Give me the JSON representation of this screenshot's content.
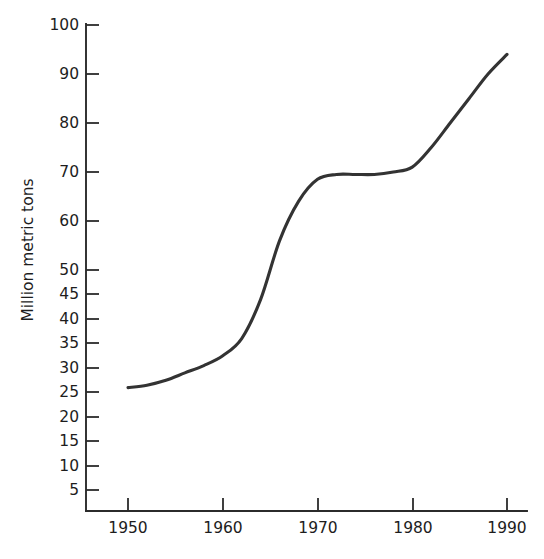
{
  "chart_data": {
    "type": "line",
    "title": "",
    "xlabel": "",
    "ylabel": "Million metric tons",
    "xlim": [
      1950,
      1990
    ],
    "ylim": [
      0,
      100
    ],
    "grid": false,
    "legend": null,
    "x_ticks": [
      1950,
      1960,
      1970,
      1980,
      1990
    ],
    "x_tick_labels": [
      "1950",
      "1960",
      "1970",
      "1980",
      "1990"
    ],
    "y_ticks": [
      5,
      10,
      15,
      20,
      25,
      30,
      35,
      40,
      45,
      50,
      60,
      70,
      80,
      90,
      100
    ],
    "y_tick_labels": [
      "5",
      "10",
      "15",
      "20",
      "25",
      "30",
      "35",
      "40",
      "45",
      "50",
      "60",
      "70",
      "80",
      "90",
      "100"
    ],
    "series": [
      {
        "name": "Million metric tons",
        "color": "#333333",
        "x": [
          1950,
          1952,
          1954,
          1956,
          1958,
          1960,
          1962,
          1964,
          1966,
          1968,
          1970,
          1972,
          1974,
          1976,
          1978,
          1980,
          1982,
          1984,
          1986,
          1988,
          1990
        ],
        "values": [
          26,
          26.5,
          27.5,
          29,
          30.5,
          32.5,
          36,
          44,
          56,
          64,
          68.5,
          69.5,
          69.5,
          69.5,
          70,
          71,
          75,
          80,
          85,
          90,
          94
        ]
      }
    ]
  },
  "axis": {
    "y_label_text": "Million metric tons"
  }
}
